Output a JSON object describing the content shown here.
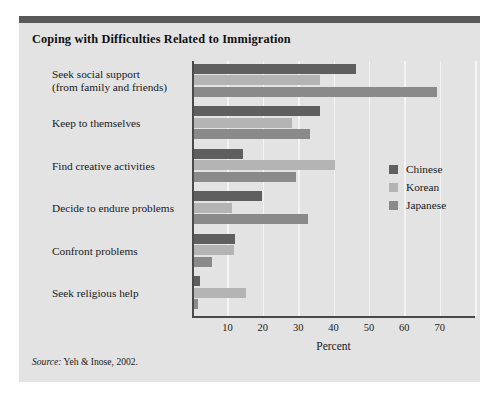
{
  "figure": {
    "title": "Coping with Difficulties Related to Immigration",
    "source_word": "Source:",
    "source_rest": " Yeh & Inose, 2002.",
    "background_color": "#e3e3e3",
    "rule_color": "#595959"
  },
  "chart_data": {
    "type": "bar",
    "orientation": "horizontal",
    "title": "Coping with Difficulties Related to Immigration",
    "xlabel": "Percent",
    "ylabel": "",
    "xlim": [
      0,
      80
    ],
    "xticks": [
      10,
      20,
      30,
      40,
      50,
      60,
      70
    ],
    "xtick_labels": [
      "10",
      "20",
      "30",
      "40",
      "50",
      "60",
      "70"
    ],
    "grid": true,
    "grid_axis": "x",
    "legend_position": "center-right",
    "categories": [
      "Seek social support\n(from family and friends)",
      "Keep to themselves",
      "Find creative activities",
      "Decide to endure problems",
      "Confront problems",
      "Seek religious help"
    ],
    "category_lines": [
      [
        "Seek social support",
        "(from family and friends)"
      ],
      [
        "Keep to themselves"
      ],
      [
        "Find creative activities"
      ],
      [
        "Decide to endure problems"
      ],
      [
        "Confront problems"
      ],
      [
        "Seek religious help"
      ]
    ],
    "series": [
      {
        "name": "Chinese",
        "color": "#5f5f5f",
        "values": [
          46,
          36,
          14,
          19.5,
          12,
          2
        ]
      },
      {
        "name": "Korean",
        "color": "#b4b4b4",
        "values": [
          36,
          28,
          40,
          11,
          11.5,
          15
        ]
      },
      {
        "name": "Japanese",
        "color": "#8a8a8a",
        "values": [
          69,
          33,
          29,
          32.5,
          5.5,
          1.5
        ]
      }
    ],
    "axis_color": "#4a4a4a",
    "gridline_color": "#f4f4f4"
  }
}
